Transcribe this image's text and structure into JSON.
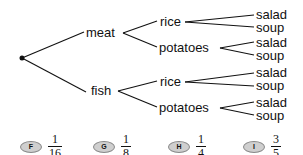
{
  "tree": {
    "root": "•",
    "level1": [
      {
        "label": "meat",
        "children": [
          {
            "label": "rice",
            "children": [
              "salad",
              "soup"
            ]
          },
          {
            "label": "potatoes",
            "children": [
              "salad",
              "soup"
            ]
          }
        ]
      },
      {
        "label": "fish",
        "children": [
          {
            "label": "rice",
            "children": [
              "salad",
              "soup"
            ]
          },
          {
            "label": "potatoes",
            "children": [
              "salad",
              "soup"
            ]
          }
        ]
      }
    ]
  },
  "answers": [
    {
      "letter": "F",
      "numerator": "1",
      "denominator": "16"
    },
    {
      "letter": "G",
      "numerator": "1",
      "denominator": "8"
    },
    {
      "letter": "H",
      "numerator": "1",
      "denominator": "4"
    },
    {
      "letter": "I",
      "numerator": "3",
      "denominator": "5"
    }
  ]
}
